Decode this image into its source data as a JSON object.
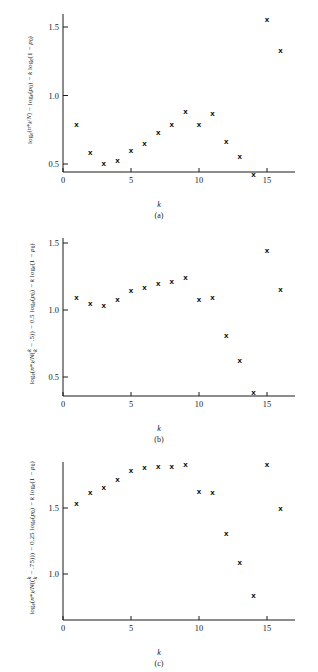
{
  "figure": {
    "xlabel": "k",
    "axis": {
      "x_ticks": [
        0,
        5,
        10,
        15
      ],
      "x_min": 0,
      "x_max": 17
    }
  },
  "chart_data": [
    {
      "type": "scatter",
      "panel": "a",
      "caption": "(a)",
      "title": "",
      "xlabel": "k",
      "ylabel": "log_e(n*_k/N) - log_e(p_0) - k log_e(1 - p_0)",
      "ylabel_parts": {
        "log_base": "e",
        "numerator": "n*",
        "numerator_sub": "k",
        "denominator": "N",
        "coefficient": "",
        "term2": "log_e(p_0)",
        "term3": "k log_e(1 - p_0)"
      },
      "marker": "x",
      "x": [
        1,
        2,
        3,
        4,
        5,
        6,
        7,
        8,
        9,
        10,
        11,
        12,
        13,
        14,
        15,
        16
      ],
      "values": [
        0.79,
        0.59,
        0.51,
        0.53,
        0.6,
        0.65,
        0.73,
        0.79,
        0.89,
        0.79,
        0.87,
        0.67,
        0.56,
        0.43,
        1.56,
        1.33
      ],
      "y_ticks": [
        0.5,
        1.0,
        1.5
      ],
      "ylim": [
        0.33,
        1.66
      ],
      "xlim": [
        0,
        17
      ],
      "grid": false,
      "legend": "none"
    },
    {
      "type": "scatter",
      "panel": "b",
      "caption": "(b)",
      "title": "",
      "xlabel": "k",
      "ylabel": "log_e(n*_k/N(k - .5)) - 0.5 log_e(p_0) - k log_e(1 - p_0)",
      "ylabel_parts": {
        "log_base": "e",
        "numerator": "n*",
        "numerator_sub": "k",
        "denominator": "N(k - .5)",
        "coefficient": "0.5",
        "term2": "log_e(p_0)",
        "term3": "k log_e(1 - p_0)"
      },
      "marker": "x",
      "x": [
        1,
        2,
        3,
        4,
        5,
        6,
        7,
        8,
        9,
        10,
        11,
        12,
        13,
        14,
        15,
        16
      ],
      "values": [
        1.1,
        1.05,
        1.04,
        1.08,
        1.15,
        1.17,
        1.2,
        1.22,
        1.25,
        1.08,
        1.1,
        0.81,
        0.63,
        0.39,
        1.45,
        1.16
      ],
      "y_ticks": [
        0.5,
        1.0,
        1.5
      ],
      "ylim": [
        0.33,
        1.66
      ],
      "xlim": [
        0,
        17
      ],
      "grid": false,
      "legend": "none"
    },
    {
      "type": "scatter",
      "panel": "c",
      "caption": "(c)",
      "title": "",
      "xlabel": "k",
      "ylabel": "log_e(n*_k/N(k - .75)) - 0.25 log_e(p_0) - k log_e(1 - p_0)",
      "ylabel_parts": {
        "log_base": "e",
        "numerator": "n*",
        "numerator_sub": "k",
        "denominator": "N(k - .75)",
        "coefficient": "0.25",
        "term2": "log_e(p_0)",
        "term3": "k log_e(1 - p_0)"
      },
      "marker": "x",
      "x": [
        1,
        2,
        3,
        4,
        5,
        6,
        7,
        8,
        9,
        10,
        11,
        12,
        13,
        14,
        15,
        16
      ],
      "values": [
        1.54,
        1.62,
        1.66,
        1.72,
        1.79,
        1.81,
        1.82,
        1.82,
        1.83,
        1.63,
        1.62,
        1.31,
        1.09,
        0.84,
        1.83,
        1.5
      ],
      "y_ticks": [
        1.0,
        1.5
      ],
      "ylim": [
        0.72,
        1.92
      ],
      "xlim": [
        0,
        17
      ],
      "grid": false,
      "legend": "none"
    }
  ]
}
